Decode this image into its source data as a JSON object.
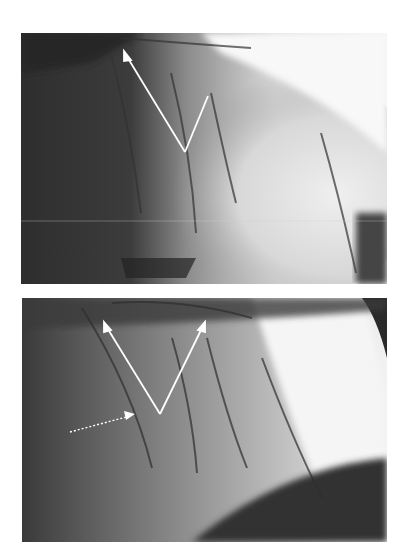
{
  "figure": {
    "panels": [
      {
        "id": "top",
        "description": "Coronary angiogram, grayscale, with two white solid arrows forming a V pointing to vessel segments",
        "annotations": [
          {
            "type": "solid-arrow",
            "from": [
              185,
              152
            ],
            "to": [
              124,
              52
            ]
          },
          {
            "type": "solid-line",
            "from": [
              185,
              152
            ],
            "to": [
              208,
              96
            ]
          }
        ],
        "overlay_text": "0017 P"
      },
      {
        "id": "bottom",
        "description": "Coronary angiogram, grayscale, with two white solid arrows forming a V and one dotted arrow",
        "annotations": [
          {
            "type": "solid-arrow",
            "from": [
              160,
              414
            ],
            "to": [
              106,
              326
            ]
          },
          {
            "type": "solid-arrow",
            "from": [
              160,
              414
            ],
            "to": [
              203,
              326
            ]
          },
          {
            "type": "dotted-arrow",
            "from": [
              70,
              432
            ],
            "to": [
              120,
              416
            ]
          }
        ]
      }
    ],
    "colors": {
      "background": "#ffffff",
      "dark": "#2a2a2a",
      "mid": "#7a7a7a",
      "light": "#f2f2f2",
      "arrow": "#ffffff"
    }
  }
}
